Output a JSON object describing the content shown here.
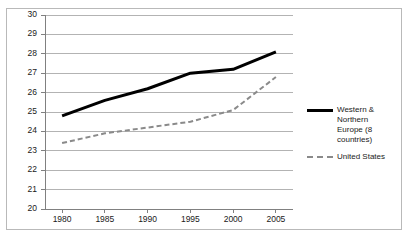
{
  "chart_data": {
    "type": "line",
    "title": "",
    "xlabel": "",
    "ylabel": "",
    "x": [
      1980,
      1985,
      1990,
      1995,
      2000,
      2005
    ],
    "categories": [
      "1980",
      "1985",
      "1990",
      "1995",
      "2000",
      "2005"
    ],
    "xlim": [
      1978,
      2007
    ],
    "ylim": [
      20,
      30
    ],
    "ytick_labels": [
      "30",
      "29",
      "28",
      "27",
      "26",
      "25",
      "24",
      "23",
      "22",
      "21",
      "20"
    ],
    "ytick_values": [
      30,
      29,
      28,
      27,
      26,
      25,
      24,
      23,
      22,
      21,
      20
    ],
    "grid": "horizontal",
    "legend_position": "right",
    "series": [
      {
        "name": "Western & Northern Europe (8 countries)",
        "name_line1": "Western & Northern",
        "name_line2": "Europe (8 countries)",
        "style": "solid",
        "color": "#000000",
        "width": 3,
        "values": [
          24.8,
          25.6,
          26.2,
          27.0,
          27.2,
          28.1
        ]
      },
      {
        "name": "United States",
        "name_line1": "United States",
        "name_line2": "",
        "style": "dashed",
        "color": "#8a8a8a",
        "width": 2,
        "values": [
          23.4,
          23.9,
          24.2,
          24.5,
          25.1,
          26.8
        ]
      }
    ]
  },
  "axes": {
    "y_labels": [
      "30",
      "29",
      "28",
      "27",
      "26",
      "25",
      "24",
      "23",
      "22",
      "21",
      "20"
    ],
    "x_labels": [
      "1980",
      "1985",
      "1990",
      "1995",
      "2000",
      "2005"
    ]
  },
  "legend": {
    "items": [
      {
        "label_line1": "Western & Northern",
        "label_line2": "Europe (8 countries)",
        "swatch": "solid-line-swatch"
      },
      {
        "label_line1": "United States",
        "label_line2": "",
        "swatch": "dashed-line-swatch"
      }
    ]
  },
  "colors": {
    "europe_line": "#000000",
    "us_line": "#8a8a8a",
    "gridline": "#b3b3b3",
    "axis": "#808080",
    "frame": "#b9b9b9",
    "text": "#1a1a1a"
  },
  "title_artifact": ""
}
